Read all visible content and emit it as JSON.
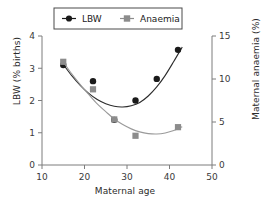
{
  "chart_data": {
    "type": "line",
    "title": "",
    "xlabel": "Maternal age",
    "ylabel": "LBW (% births)",
    "ylabel_right": "Maternal anaemia (%)",
    "xlim": [
      10,
      50
    ],
    "ylim": [
      0,
      4
    ],
    "ylim_right": [
      0,
      15
    ],
    "xticks": [
      "10",
      "20",
      "30",
      "40",
      "50"
    ],
    "xtick_values": [
      10,
      20,
      30,
      40,
      50
    ],
    "yticks": [
      "0",
      "1",
      "2",
      "3",
      "4"
    ],
    "ytick_values": [
      0,
      1,
      2,
      3,
      4
    ],
    "yticks_right": [
      "0",
      "5",
      "10",
      "15"
    ],
    "ytick_right_values": [
      0,
      5,
      10,
      15
    ],
    "grid": false,
    "legend_position": "top-center",
    "series": [
      {
        "name": "LBW",
        "axis": "left",
        "marker": "circle",
        "color": "#1a1a1a",
        "line_color": "#2b2b2b",
        "x": [
          15,
          22,
          27,
          32,
          37,
          42
        ],
        "values": [
          3.1,
          2.6,
          1.4,
          2.0,
          2.67,
          3.57
        ],
        "fit": {
          "x": [
            15,
            17,
            19,
            21,
            23,
            25,
            27,
            29,
            31,
            33,
            35,
            37,
            39,
            41,
            43
          ],
          "y": [
            3.12,
            2.77,
            2.47,
            2.22,
            2.03,
            1.9,
            1.82,
            1.8,
            1.84,
            1.94,
            2.14,
            2.42,
            2.78,
            3.21,
            3.66
          ]
        }
      },
      {
        "name": "Anaemia",
        "axis": "right",
        "marker": "square",
        "color": "#8c8c8c",
        "line_color": "#9a9a9a",
        "x": [
          15,
          22,
          27,
          32,
          42
        ],
        "values": [
          12.0,
          8.8,
          5.3,
          3.4,
          4.4
        ],
        "fit": {
          "x": [
            15,
            17,
            19,
            21,
            23,
            25,
            27,
            29,
            31,
            33,
            35,
            37,
            39,
            41,
            43
          ],
          "y": [
            12.0,
            10.6,
            9.35,
            8.2,
            7.1,
            6.2,
            5.35,
            4.7,
            4.2,
            3.85,
            3.65,
            3.6,
            3.72,
            4.0,
            4.45
          ]
        }
      }
    ],
    "legend": [
      {
        "label": "LBW",
        "marker": "circle",
        "color": "#1a1a1a"
      },
      {
        "label": "Anaemia",
        "marker": "square",
        "color": "#8c8c8c"
      }
    ]
  },
  "axis_colors": {
    "axis_line": "#7d7d7d",
    "text": "#2b2b2b",
    "background": "#ffffff"
  }
}
